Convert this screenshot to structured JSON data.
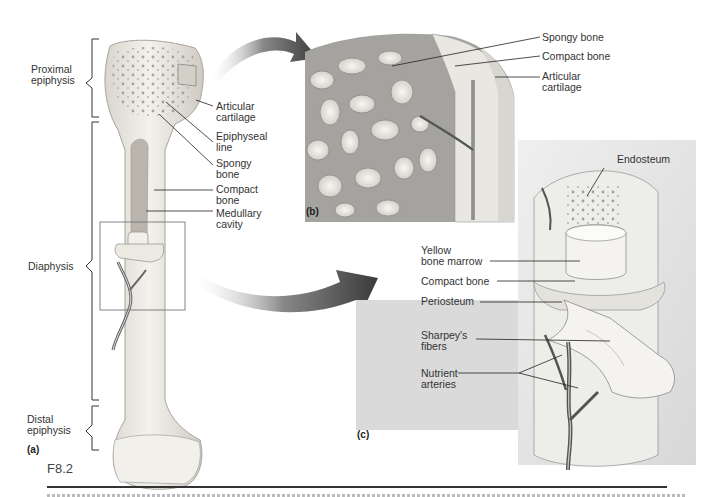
{
  "figure": {
    "id": "F8.2",
    "panels": [
      {
        "tag": "(a)",
        "description": "whole long bone, longitudinal section of proximal end"
      },
      {
        "tag": "(b)",
        "description": "enlarged view of proximal epiphysis"
      },
      {
        "tag": "(c)",
        "description": "enlarged view of diaphysis segment"
      }
    ]
  },
  "panel_a": {
    "tag": "(a)",
    "regions": [
      {
        "label": "Proximal\nepiphysis"
      },
      {
        "label": "Diaphysis"
      },
      {
        "label": "Distal\nepiphysis"
      }
    ],
    "callouts": [
      {
        "label": "Articular\ncartilage"
      },
      {
        "label": "Epiphyseal\nline"
      },
      {
        "label": "Spongy\nbone"
      },
      {
        "label": "Compact\nbone"
      },
      {
        "label": "Medullary\ncavity"
      }
    ]
  },
  "panel_b": {
    "tag": "(b)",
    "callouts": [
      {
        "label": "Spongy bone"
      },
      {
        "label": "Compact bone"
      },
      {
        "label": "Articular\ncartilage"
      }
    ]
  },
  "panel_c": {
    "tag": "(c)",
    "callouts": [
      {
        "label": "Endosteum"
      },
      {
        "label": "Yellow\nbone marrow"
      },
      {
        "label": "Compact bone"
      },
      {
        "label": "Periosteum"
      },
      {
        "label": "Sharpey's\nfibers"
      },
      {
        "label": "Nutrient\narteries"
      }
    ]
  },
  "colors": {
    "bone": "#ece9e2",
    "bone_shade": "#c9c5bc",
    "spongy": "#8e8c88",
    "arrow": "#3c3c3c",
    "inset_bg": "#e6e6e6",
    "line": "#222222"
  }
}
